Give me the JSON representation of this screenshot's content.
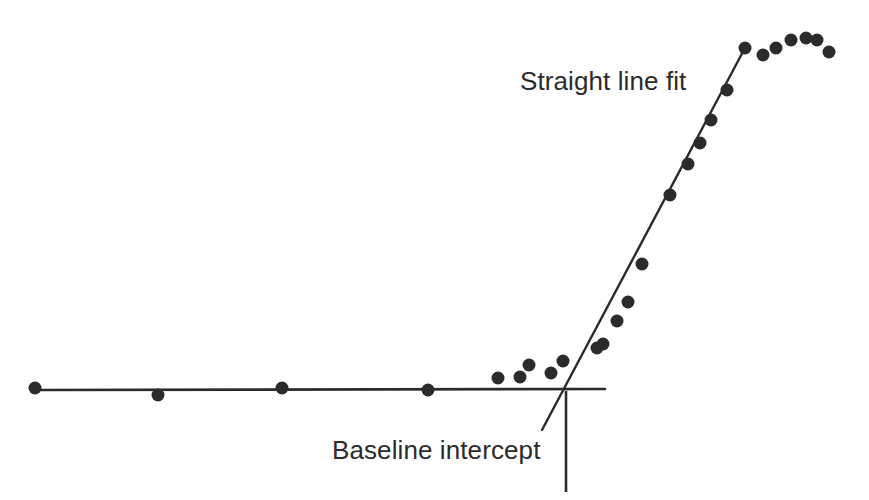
{
  "figure": {
    "width": 869,
    "height": 500,
    "background_color": "#ffffff",
    "ink_color": "#2b2b2b"
  },
  "annotations": {
    "straight_line_fit_label": "Straight line fit",
    "baseline_intercept_label": "Baseline intercept"
  },
  "chart_data": {
    "type": "scatter",
    "title": "",
    "subtitle": "",
    "xlabel": "",
    "ylabel": "",
    "xlim": [
      0,
      869
    ],
    "ylim": [
      500,
      0
    ],
    "grid": false,
    "legend": false,
    "legend_position": "none",
    "axis_ticks": [],
    "tick_labels": [],
    "marker": {
      "shape": "circle",
      "color": "#2b2b2b",
      "radius": 6.5
    },
    "series": [
      {
        "name": "data points",
        "type": "scatter",
        "points": [
          [
            35,
            388
          ],
          [
            158,
            395
          ],
          [
            282,
            388
          ],
          [
            428,
            390
          ],
          [
            498,
            378
          ],
          [
            520,
            377
          ],
          [
            529,
            365
          ],
          [
            551,
            373
          ],
          [
            563,
            361
          ],
          [
            597,
            348
          ],
          [
            603,
            344
          ],
          [
            617,
            321
          ],
          [
            628,
            302
          ],
          [
            642,
            264
          ],
          [
            670,
            195
          ],
          [
            688,
            164
          ],
          [
            700,
            143
          ],
          [
            711,
            120
          ],
          [
            727,
            90
          ],
          [
            745,
            48
          ],
          [
            763,
            55
          ],
          [
            776,
            48
          ],
          [
            791,
            40
          ],
          [
            806,
            38
          ],
          [
            817,
            40
          ],
          [
            829,
            52
          ]
        ]
      }
    ],
    "lines": [
      {
        "name": "baseline",
        "role": "flat baseline through low-signal points",
        "x1": 38,
        "y1": 390,
        "x2": 605,
        "y2": 389,
        "width": 2.6,
        "color": "#2b2b2b"
      },
      {
        "name": "straight-line-fit",
        "role": "linear fit through the steeply rising points, extrapolated below the baseline",
        "x1": 542,
        "y1": 430,
        "x2": 746,
        "y2": 46,
        "width": 2.4,
        "color": "#2b2b2b"
      },
      {
        "name": "intercept-marker",
        "role": "vertical drop line from the intersection marking the baseline intercept",
        "x1": 566,
        "y1": 391,
        "x2": 566,
        "y2": 492,
        "width": 2.6,
        "color": "#2b2b2b"
      }
    ],
    "intersection_point": [
      564,
      390
    ]
  }
}
